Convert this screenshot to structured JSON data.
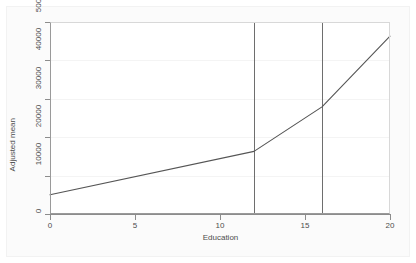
{
  "chart_data": {
    "type": "line",
    "title": "",
    "xlabel": "Education",
    "ylabel": "Adjusted mean",
    "xlim": [
      0,
      20
    ],
    "ylim": [
      0,
      50000
    ],
    "xticks": [
      0,
      5,
      10,
      15,
      20
    ],
    "xtick_labels": [
      "0",
      "5",
      "10",
      "15",
      "20"
    ],
    "yticks": [
      0,
      10000,
      20000,
      30000,
      40000,
      50000
    ],
    "ytick_labels": [
      "0",
      "10000",
      "20000",
      "30000",
      "40000",
      "50000"
    ],
    "grid": "horizontal",
    "legend": "none",
    "series": [
      {
        "name": "Adjusted mean",
        "color": "#555555",
        "x": [
          0,
          12,
          16,
          20
        ],
        "values": [
          5000,
          16300,
          27900,
          46300
        ]
      }
    ],
    "reference_lines": [
      {
        "name": "knot-12",
        "axis": "x",
        "value": 12,
        "color": "#6e6e6e"
      },
      {
        "name": "knot-16",
        "axis": "x",
        "value": 16,
        "color": "#6e6e6e"
      }
    ],
    "colors": {
      "line": "#555555",
      "reference_line": "#6e6e6e",
      "gridline": "#f4f4f4",
      "axis": "#8c8c8c",
      "plot_background": "#ffffff",
      "figure_background": "#fbfbfb",
      "tick_label": "#4d4d4d"
    }
  }
}
